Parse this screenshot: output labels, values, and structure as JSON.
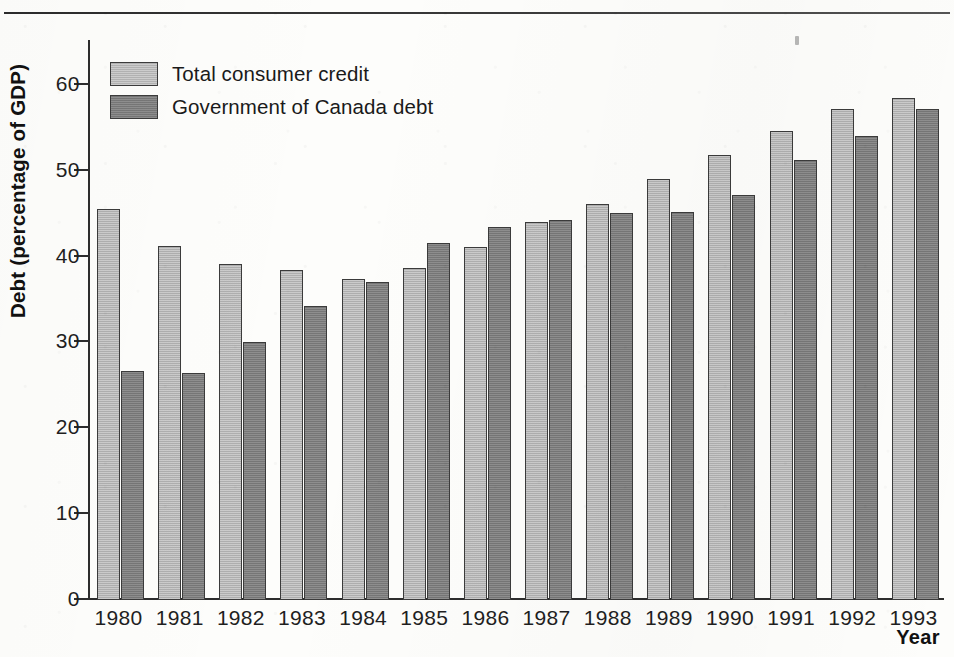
{
  "figure": {
    "y_axis_title": "Debt (percentage of GDP)",
    "x_axis_title": "Year"
  },
  "legend": {
    "items": [
      {
        "label": "Total consumer credit",
        "swatch": "light-gray-swatch",
        "color": "#b8b8b8"
      },
      {
        "label": "Government of Canada debt",
        "swatch": "dark-gray-swatch",
        "color": "#7c7c7c"
      }
    ]
  },
  "chart_data": {
    "type": "bar",
    "title": "",
    "xlabel": "Year",
    "ylabel": "Debt (percentage of GDP)",
    "ylim": [
      0,
      65
    ],
    "yticks": [
      0,
      10,
      20,
      30,
      40,
      50,
      60
    ],
    "ytick_labels": [
      "0",
      "10",
      "20",
      "30",
      "40",
      "50",
      "60"
    ],
    "grid": false,
    "legend_position": "upper-left-inside",
    "categories": [
      "1980",
      "1981",
      "1982",
      "1983",
      "1984",
      "1985",
      "1986",
      "1987",
      "1988",
      "1989",
      "1990",
      "1991",
      "1992",
      "1993"
    ],
    "series": [
      {
        "name": "Total consumer credit",
        "color": "#b8b8b8",
        "values": [
          45.5,
          41.2,
          39.1,
          38.5,
          37.4,
          38.7,
          41.1,
          44.0,
          46.1,
          49.1,
          51.8,
          54.6,
          57.2,
          58.5
        ]
      },
      {
        "name": "Government of Canada debt",
        "color": "#7c7c7c",
        "values": [
          26.7,
          26.5,
          30.1,
          34.2,
          37.1,
          41.6,
          43.5,
          44.3,
          45.1,
          45.2,
          47.2,
          51.3,
          54.1,
          57.2
        ]
      }
    ]
  }
}
